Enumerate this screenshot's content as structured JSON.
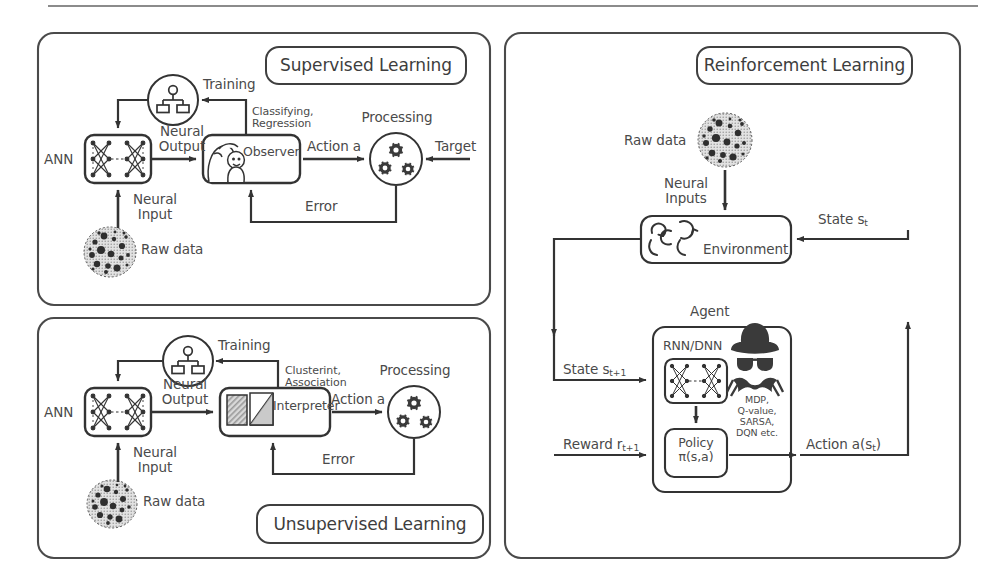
{
  "figure": {
    "title_supervised": "Supervised Learning",
    "title_unsupervised": "Unsupervised Learning",
    "title_reinforcement": "Reinforcement Learning",
    "line_color": "#3a3a3a",
    "text_color": "#4a4a4a",
    "background": "#ffffff"
  },
  "supervised": {
    "title": "Supervised Learning",
    "ann_label": "ANN",
    "raw_data": "Raw data",
    "neural_input": "Neural\nInput",
    "neural_output": "Neural\nOutput",
    "training": "Training",
    "classifying": "Classifying,\nRegression",
    "observer": "Observer",
    "action": "Action a",
    "processing": "Processing",
    "target": "Target",
    "error": "Error"
  },
  "unsupervised": {
    "title": "Unsupervised Learning",
    "ann_label": "ANN",
    "raw_data": "Raw data",
    "neural_input": "Neural\nInput",
    "neural_output": "Neural\nOutput",
    "training": "Training",
    "clustering": "Clusterint,\nAssociation",
    "interpreter": "Interpreter",
    "action": "Action a",
    "processing": "Processing",
    "error": "Error"
  },
  "reinforcement": {
    "title": "Reinforcement Learning",
    "raw_data": "Raw data",
    "neural_inputs": "Neural\nInputs",
    "environment": "Environment",
    "state_t": "State s",
    "state_t_sub": "t",
    "agent": "Agent",
    "rnn_dnn": "RNN/DNN",
    "policy_line1": "Policy",
    "policy_line2": "π(s,a)",
    "state_next": "State s",
    "state_next_sub": "t+1",
    "reward": "Reward r",
    "reward_sub": "t+1",
    "algorithms": "MDP,\nQ-value,\nSARSA,\nDQN etc.",
    "action": "Action a(s",
    "action_sub": "t",
    "action_end": ")"
  },
  "icons": {
    "training": "hierarchy-icon",
    "observer": "people-face-icon",
    "interpreter": "chart-panels-icon",
    "processing": "gears-icon",
    "raw_data": "noisy-blob-icon",
    "ann": "neural-network-icon",
    "environment": "recycle-arrows-icon",
    "agent": "spy-icon"
  }
}
